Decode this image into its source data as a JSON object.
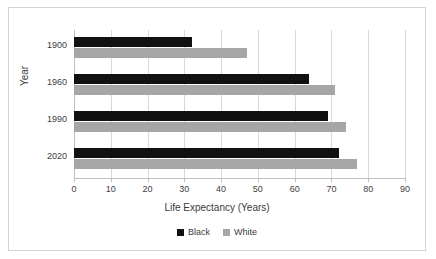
{
  "chart_data": {
    "type": "bar",
    "orientation": "horizontal",
    "title": "",
    "xlabel": "Life Expectancy (Years)",
    "ylabel": "Year",
    "categories": [
      "1900",
      "1960",
      "1990",
      "2020"
    ],
    "series": [
      {
        "name": "Black",
        "color": "#111111",
        "values": [
          32,
          64,
          69,
          72
        ]
      },
      {
        "name": "White",
        "color": "#a6a6a6",
        "values": [
          47,
          71,
          74,
          77
        ]
      }
    ],
    "xlim": [
      0,
      90
    ],
    "xticks": [
      0,
      10,
      20,
      30,
      40,
      50,
      60,
      70,
      80,
      90
    ],
    "xtick_labels": [
      "0",
      "10",
      "20",
      "30",
      "40",
      "50",
      "60",
      "70",
      "80",
      "90"
    ],
    "grid": "vertical",
    "legend_position": "bottom"
  },
  "legend": {
    "entries": [
      {
        "label": "Black"
      },
      {
        "label": "White"
      }
    ]
  }
}
